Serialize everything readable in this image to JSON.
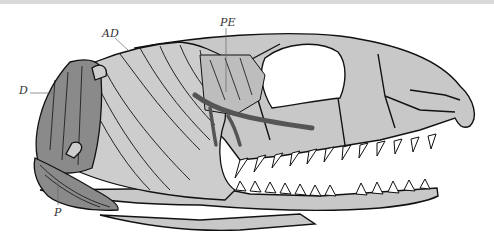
{
  "figure": {
    "labels": [
      {
        "id": "D",
        "text": "D",
        "x": 19,
        "y": 85
      },
      {
        "id": "AD",
        "text": "AD",
        "x": 102,
        "y": 28
      },
      {
        "id": "PE",
        "text": "PE",
        "x": 220,
        "y": 17
      },
      {
        "id": "P",
        "text": "P",
        "x": 54,
        "y": 207
      }
    ],
    "colors": {
      "background": "#ffffff",
      "bone": "#c8c8c8",
      "muscle_light": "#cdcdcd",
      "muscle_dark": "#8a8a8a",
      "tendon": "#555555",
      "outline": "#111111",
      "teeth": "#ffffff",
      "label": "#333333",
      "top_border": "#d9d9d9"
    }
  }
}
